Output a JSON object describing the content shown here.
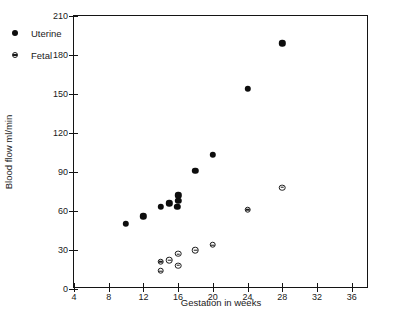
{
  "chart_data": {
    "type": "scatter",
    "title": "",
    "xlabel": "Gestation in weeks",
    "ylabel": "Blood flow ml/min",
    "xlim": [
      4,
      38
    ],
    "ylim": [
      0,
      210
    ],
    "xticks": [
      4,
      8,
      12,
      16,
      20,
      24,
      28,
      32,
      36
    ],
    "yticks": [
      0,
      30,
      60,
      90,
      120,
      150,
      180,
      210
    ],
    "xtick_labels": [
      "4",
      "8",
      "12",
      "16",
      "20",
      "24",
      "28",
      "32",
      "36"
    ],
    "ytick_labels": [
      "0",
      "30",
      "60",
      "90",
      "120",
      "150",
      "180",
      "210"
    ],
    "grid": false,
    "legend_position": "upper-left-inside",
    "series": [
      {
        "name": "Uterine",
        "marker": "filled-circle",
        "color": "#0d0d0d",
        "points": [
          {
            "x": 10,
            "y": 50
          },
          {
            "x": 12,
            "y": 56
          },
          {
            "x": 14,
            "y": 63
          },
          {
            "x": 15,
            "y": 66
          },
          {
            "x": 15.9,
            "y": 63
          },
          {
            "x": 16,
            "y": 68
          },
          {
            "x": 16,
            "y": 72
          },
          {
            "x": 18,
            "y": 91
          },
          {
            "x": 20,
            "y": 103
          },
          {
            "x": 24,
            "y": 154
          },
          {
            "x": 28,
            "y": 189
          }
        ]
      },
      {
        "name": "Fetal",
        "marker": "circle-with-bar",
        "color": "#1a1a1a",
        "points": [
          {
            "x": 14,
            "y": 14
          },
          {
            "x": 14,
            "y": 21
          },
          {
            "x": 15,
            "y": 22
          },
          {
            "x": 16,
            "y": 18
          },
          {
            "x": 16,
            "y": 27
          },
          {
            "x": 18,
            "y": 30
          },
          {
            "x": 20,
            "y": 34
          },
          {
            "x": 24,
            "y": 61
          },
          {
            "x": 28,
            "y": 78
          }
        ]
      }
    ]
  },
  "legend": {
    "entries": [
      {
        "label": "Uterine",
        "marker": "filled-circle"
      },
      {
        "label": "Fetal",
        "marker": "circle-with-bar"
      }
    ]
  }
}
